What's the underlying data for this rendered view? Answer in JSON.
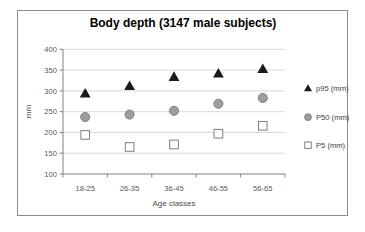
{
  "chart_data": {
    "type": "scatter",
    "title": "Body depth (3147 male subjects)",
    "xlabel": "Age classes",
    "ylabel": "mm",
    "categories": [
      "18-25",
      "26-35",
      "36-45",
      "46-55",
      "56-65"
    ],
    "series": [
      {
        "name": "p95 (mm)",
        "marker": "triangle",
        "fill": "#1a1a1a",
        "stroke": "#1a1a1a",
        "values": [
          294,
          312,
          334,
          342,
          353
        ]
      },
      {
        "name": "P50 (mm)",
        "marker": "circle",
        "fill": "#9e9e9e",
        "stroke": "#7f7f7f",
        "values": [
          237,
          243,
          252,
          269,
          283
        ]
      },
      {
        "name": "P5 (mm)",
        "marker": "square",
        "fill": "#ffffff",
        "stroke": "#7f7f7f",
        "values": [
          194,
          165,
          171,
          197,
          216
        ]
      }
    ],
    "ylim": [
      100,
      400
    ],
    "yticks": [
      100,
      150,
      200,
      250,
      300,
      350,
      400
    ],
    "grid": true,
    "legend_position": "right",
    "colors": {
      "gridline": "#d9d9d9",
      "axis": "#808080",
      "tick_label": "#595959",
      "legend_text": "#404040",
      "title_text": "#000000",
      "frame_border": "#8c8c8c",
      "background": "#ffffff"
    }
  }
}
